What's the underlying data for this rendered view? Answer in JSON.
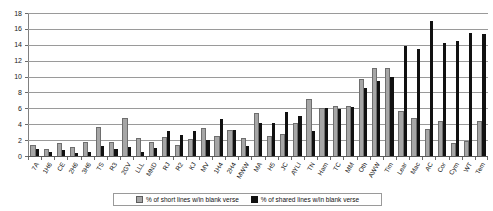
{
  "chart_data": {
    "type": "bar",
    "title": "",
    "xlabel": "",
    "ylabel": "",
    "ylim": [
      0,
      18
    ],
    "yticks": [
      0,
      2,
      4,
      6,
      8,
      10,
      12,
      14,
      16,
      18
    ],
    "grid": true,
    "legend_position": "bottom",
    "categories": [
      "7A",
      "1H6",
      "CE",
      "2H6",
      "3H6",
      "TS",
      "R3",
      "2GV",
      "LLL",
      "MND",
      "RJ",
      "R2",
      "KJ",
      "MV",
      "1H4",
      "2H4",
      "MWW",
      "MA",
      "H5",
      "JC",
      "AYLI",
      "TN",
      "Ham",
      "TC",
      "MM",
      "Oth",
      "AWW",
      "Tim",
      "Lear",
      "Mac",
      "AC",
      "Cor",
      "Cym",
      "WT",
      "Tem"
    ],
    "series": [
      {
        "name": "% of short lines w/in blank verse",
        "color": "#a6a6a6",
        "values": [
          1.3,
          0.8,
          1.5,
          1.0,
          1.6,
          3.5,
          1.7,
          4.6,
          2.2,
          1.6,
          2.3,
          1.3,
          2.0,
          3.4,
          2.4,
          3.2,
          2.2,
          5.3,
          2.4,
          2.6,
          4.0,
          7.1,
          5.9,
          6.2,
          6.2,
          9.6,
          10.9,
          11.0,
          5.6,
          4.6,
          3.3,
          4.3,
          1.5,
          1.8,
          4.3
        ]
      },
      {
        "name": "% of shared lines w/in blank verse",
        "color": "#111111",
        "values": [
          0.9,
          0.5,
          0.8,
          0.4,
          0.5,
          1.3,
          0.9,
          1.1,
          0.5,
          1.0,
          3.2,
          2.7,
          3.2,
          2.0,
          4.6,
          3.3,
          1.2,
          4.2,
          4.1,
          5.6,
          5.0,
          3.1,
          6.1,
          5.9,
          6.2,
          8.5,
          9.5,
          10.0,
          13.9,
          13.5,
          17.0,
          14.2,
          14.5,
          15.5,
          15.4
        ]
      }
    ]
  },
  "legend": {
    "items": [
      {
        "label": "% of short lines w/in blank verse"
      },
      {
        "label": "% of shared lines w/in blank verse"
      }
    ]
  }
}
